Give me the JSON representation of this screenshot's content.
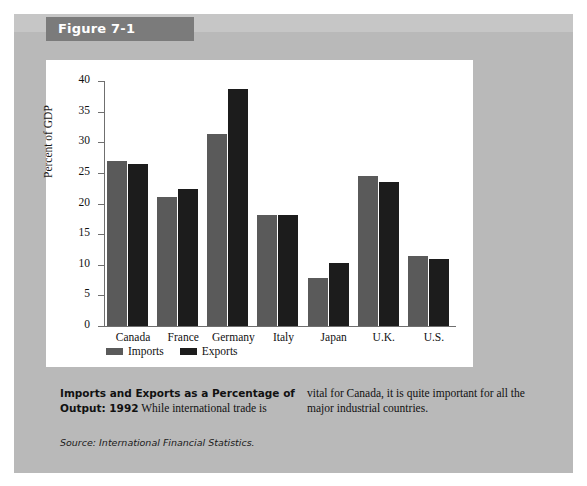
{
  "figure": {
    "tag": "Figure 7-1",
    "caption_title": "Imports and Exports as a Percentage of Output: 1992",
    "caption_left": "While international trade is",
    "caption_right": "vital for Canada, it is quite important for all the major industrial countries.",
    "source": "Source: International Financial Statistics."
  },
  "colors": {
    "panel": "#b9b9b9",
    "tag": "#7b7b7b",
    "imports": "#5a5a5a",
    "exports": "#1c1c1c",
    "plot_bg": "#ffffff"
  },
  "chart_data": {
    "type": "bar",
    "title": "",
    "xlabel": "",
    "ylabel": "Percent of GDP",
    "ylim": [
      0,
      40
    ],
    "yticks": [
      0,
      5,
      10,
      15,
      20,
      25,
      30,
      35,
      40
    ],
    "grid": false,
    "legend_position": "below-axis-left",
    "categories": [
      "Canada",
      "France",
      "Germany",
      "Italy",
      "Japan",
      "U.K.",
      "U.S."
    ],
    "series": [
      {
        "name": "Imports",
        "color": "#5a5a5a",
        "values": [
          27.0,
          21.1,
          31.3,
          18.2,
          7.8,
          24.5,
          11.5
        ]
      },
      {
        "name": "Exports",
        "color": "#1c1c1c",
        "values": [
          26.5,
          22.3,
          38.7,
          18.2,
          10.3,
          23.5,
          11.0
        ]
      }
    ]
  }
}
